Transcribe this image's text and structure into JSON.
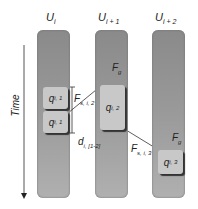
{
  "columns": [
    {
      "label": "U",
      "sub": "i"
    },
    {
      "label": "U",
      "sub": "i + 1"
    },
    {
      "label": "U",
      "sub": "i + 2"
    }
  ],
  "axis": {
    "label": "Time"
  },
  "boxes": [
    {
      "label": "q",
      "sub": "i, 1"
    },
    {
      "label": "q",
      "sub": "i, 1"
    },
    {
      "label": "q",
      "sub": "i, 2"
    },
    {
      "label": "q",
      "sub": "i, 3"
    }
  ],
  "forces": {
    "fg": {
      "label": "F",
      "sub": "g"
    },
    "fs12": {
      "label": "F",
      "sub": "s, i, 2"
    },
    "fs13": {
      "label": "F",
      "sub": "s, i, 3"
    },
    "d": {
      "label": "d",
      "sub": "i, [1-2]"
    }
  }
}
